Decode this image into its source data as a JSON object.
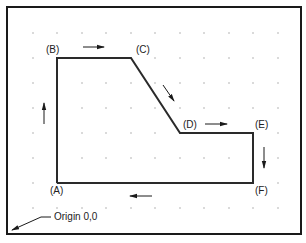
{
  "diagram": {
    "type": "toolpath-plot",
    "frame": {
      "x": 7,
      "y": 7,
      "width": 294,
      "height": 227,
      "stroke": "#1a1a1a"
    },
    "grid": {
      "dot_color": "#9a9a9a",
      "x_positions": [
        33,
        57,
        82,
        106,
        131,
        155,
        180,
        204,
        229,
        253,
        278
      ],
      "y_positions": [
        33,
        58,
        83,
        108,
        133,
        158,
        183,
        208
      ]
    },
    "path": {
      "stroke": "#2a2a2a",
      "points": [
        {
          "id": "A",
          "label": "(A)",
          "x": 57,
          "y": 183,
          "label_x": 50,
          "label_y": 186
        },
        {
          "id": "B",
          "label": "(B)",
          "x": 57,
          "y": 58,
          "label_x": 46,
          "label_y": 45
        },
        {
          "id": "C",
          "label": "(C)",
          "x": 131,
          "y": 58,
          "label_x": 136,
          "label_y": 45
        },
        {
          "id": "D",
          "label": "(D)",
          "x": 180,
          "y": 133,
          "label_x": 183,
          "label_y": 120
        },
        {
          "id": "E",
          "label": "(E)",
          "x": 253,
          "y": 133,
          "label_x": 255,
          "label_y": 120
        },
        {
          "id": "F",
          "label": "(F)",
          "x": 253,
          "y": 183,
          "label_x": 255,
          "label_y": 186
        }
      ]
    },
    "direction_arrows": [
      {
        "id": "up-left-side",
        "x1": 44,
        "y1": 124,
        "x2": 44,
        "y2": 103
      },
      {
        "id": "right-top",
        "x1": 83,
        "y1": 47,
        "x2": 104,
        "y2": 47
      },
      {
        "id": "down-diagonal",
        "x1": 163,
        "y1": 85,
        "x2": 174,
        "y2": 101
      },
      {
        "id": "right-step",
        "x1": 205,
        "y1": 124,
        "x2": 227,
        "y2": 124
      },
      {
        "id": "down-right-side",
        "x1": 264,
        "y1": 147,
        "x2": 264,
        "y2": 168
      },
      {
        "id": "left-bottom",
        "x1": 152,
        "y1": 196,
        "x2": 130,
        "y2": 196
      }
    ],
    "origin": {
      "label": "Origin 0,0",
      "label_x": 54,
      "label_y": 212,
      "leader": {
        "x1": 51,
        "y1": 217,
        "x2": 41,
        "y2": 217,
        "x3": 12,
        "y3": 230
      }
    }
  }
}
